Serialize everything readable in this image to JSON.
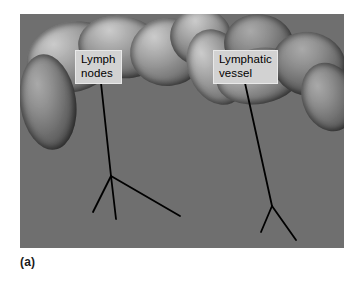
{
  "figure": {
    "caption": "(a)",
    "kind": "anatomical-dissection-photograph",
    "color_mode": "grayscale",
    "canvas": {
      "width": 362,
      "height": 281,
      "background": "#ffffff"
    },
    "photo": {
      "left": 20,
      "top": 14,
      "width": 324,
      "height": 234,
      "border_color": "#ffffff"
    }
  },
  "labels": [
    {
      "id": "lymph-nodes",
      "text": "Lymph\nnodes",
      "box": {
        "left": 75,
        "top": 50,
        "background": "#d2d2d2",
        "text_color": "#000000"
      },
      "leader": {
        "color": "#000000",
        "width": 1.8,
        "stem": {
          "x1": 101,
          "y1": 83,
          "x2": 111,
          "y2": 176
        },
        "branches": [
          {
            "x1": 111,
            "y1": 176,
            "x2": 93,
            "y2": 212
          },
          {
            "x1": 111,
            "y1": 176,
            "x2": 116,
            "y2": 219
          },
          {
            "x1": 111,
            "y1": 176,
            "x2": 180,
            "y2": 216
          }
        ]
      }
    },
    {
      "id": "lymphatic-vessel",
      "text": "Lymphatic\nvessel",
      "box": {
        "left": 213,
        "top": 50,
        "background": "#d2d2d2",
        "text_color": "#000000"
      },
      "leader": {
        "color": "#000000",
        "width": 1.8,
        "stem": {
          "x1": 245,
          "y1": 83,
          "x2": 272,
          "y2": 206
        },
        "branches": [
          {
            "x1": 272,
            "y1": 206,
            "x2": 261,
            "y2": 232
          },
          {
            "x1": 272,
            "y1": 206,
            "x2": 296,
            "y2": 240
          }
        ]
      }
    }
  ]
}
